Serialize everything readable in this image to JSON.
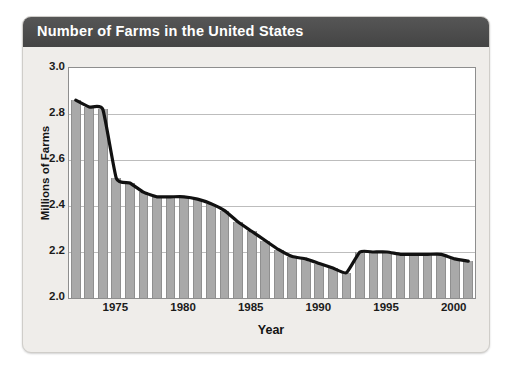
{
  "card": {
    "title": "Number of Farms in the United States",
    "title_bar_color": "#4b4b4b",
    "body_color": "#efedea"
  },
  "chart_data": {
    "type": "bar",
    "title": "Number of Farms in the United States",
    "xlabel": "Year",
    "ylabel": "Millions of Farms",
    "xlim": [
      1971.5,
      2001.5
    ],
    "ylim": [
      2.0,
      3.0
    ],
    "grid": true,
    "legend": null,
    "bar_color": "#a9a9a9",
    "line_color": "#111111",
    "ytick_labels": [
      "3.0",
      "2.8",
      "2.6",
      "2.4",
      "2.2",
      "2.0"
    ],
    "ytick_values": [
      3.0,
      2.8,
      2.6,
      2.4,
      2.2,
      2.0
    ],
    "xtick_labels": [
      "1975",
      "1980",
      "1985",
      "1990",
      "1995",
      "2000"
    ],
    "xtick_values": [
      1975,
      1980,
      1985,
      1990,
      1995,
      2000
    ],
    "categories": [
      1972,
      1973,
      1974,
      1975,
      1976,
      1977,
      1978,
      1979,
      1980,
      1981,
      1982,
      1983,
      1984,
      1985,
      1986,
      1987,
      1988,
      1989,
      1990,
      1991,
      1992,
      1993,
      1994,
      1995,
      1996,
      1997,
      1998,
      1999,
      2000,
      2001
    ],
    "values": [
      2.86,
      2.83,
      2.82,
      2.52,
      2.5,
      2.46,
      2.44,
      2.44,
      2.44,
      2.43,
      2.41,
      2.38,
      2.33,
      2.29,
      2.25,
      2.21,
      2.18,
      2.17,
      2.15,
      2.13,
      2.11,
      2.2,
      2.2,
      2.2,
      2.19,
      2.19,
      2.19,
      2.19,
      2.17,
      2.16
    ]
  }
}
